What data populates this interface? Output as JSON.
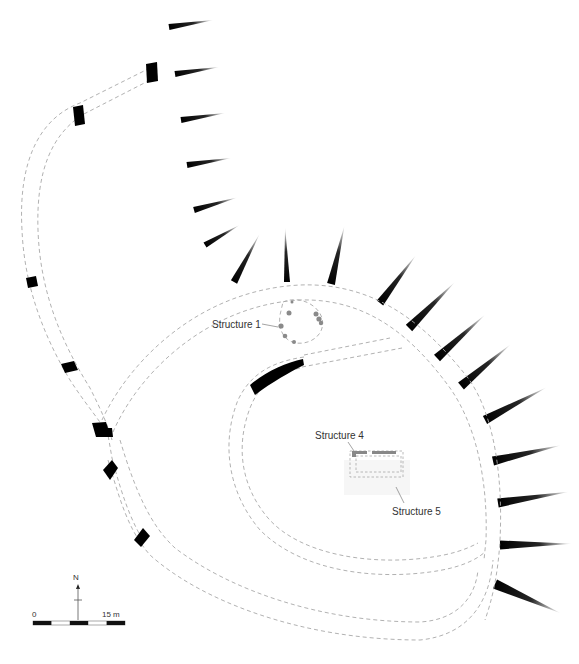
{
  "figure": {
    "type": "archaeological site plan",
    "background": "#ffffff"
  },
  "labels": {
    "structure1": "Structure 1",
    "structure4": "Structure 4",
    "structure5": "Structure 5"
  },
  "north_arrow": {
    "label": "N"
  },
  "scale_bar": {
    "start_label": "0",
    "end_label": "15 m",
    "segments": 5
  },
  "colors": {
    "wall_fill": "#000000",
    "trackway_dash": "#a8a8a8",
    "structure_fill": "#888888",
    "label_text": "#333333"
  }
}
